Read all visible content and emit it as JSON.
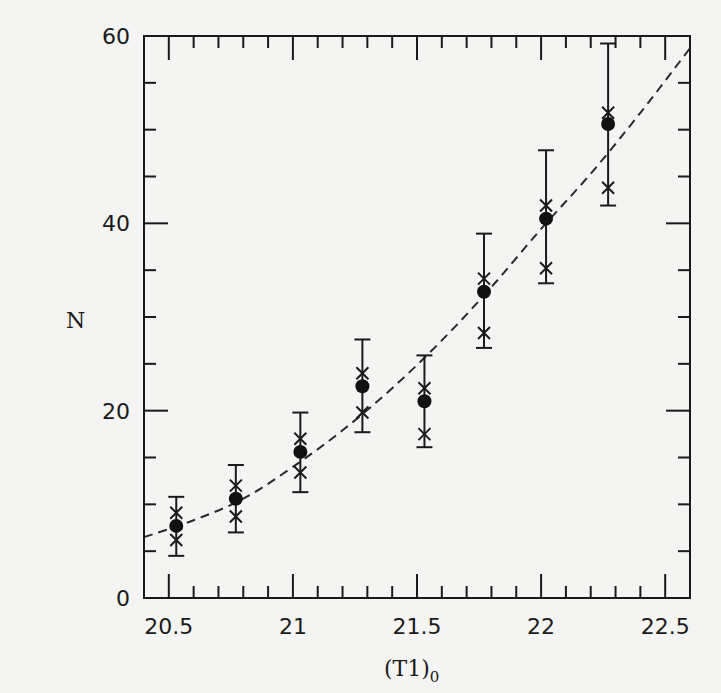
{
  "chart_data": {
    "type": "scatter",
    "title": "",
    "xlabel": "(T1)",
    "xlabel_subscript": "0",
    "ylabel": "N",
    "xlim": [
      20.4,
      22.6
    ],
    "ylim": [
      0,
      60
    ],
    "grid": false,
    "legend": null,
    "x_ticks_major": [
      20.5,
      21,
      21.5,
      22,
      22.5
    ],
    "x_tick_labels": [
      "20.5",
      "21",
      "21.5",
      "22",
      "22.5"
    ],
    "x_minor_step": 0.1,
    "y_ticks_major": [
      0,
      20,
      40,
      60
    ],
    "y_tick_labels": [
      "0",
      "20",
      "40",
      "60"
    ],
    "y_minor_step": 5,
    "series": [
      {
        "name": "observed N (filled circles with error bars)",
        "marker": "filled-circle",
        "points": [
          {
            "x": 20.53,
            "y": 7.7,
            "err_low": 4.5,
            "err_high": 10.8,
            "cross_high": 9.1,
            "cross_low": 6.2
          },
          {
            "x": 20.77,
            "y": 10.6,
            "err_low": 7.0,
            "err_high": 14.2,
            "cross_high": 12.0,
            "cross_low": 8.7
          },
          {
            "x": 21.03,
            "y": 15.6,
            "err_low": 11.3,
            "err_high": 19.8,
            "cross_high": 17.0,
            "cross_low": 13.4
          },
          {
            "x": 21.28,
            "y": 22.6,
            "err_low": 17.7,
            "err_high": 27.6,
            "cross_high": 24.0,
            "cross_low": 19.8
          },
          {
            "x": 21.53,
            "y": 21.0,
            "err_low": 16.1,
            "err_high": 25.9,
            "cross_high": 22.4,
            "cross_low": 17.5
          },
          {
            "x": 21.77,
            "y": 32.7,
            "err_low": 26.7,
            "err_high": 38.9,
            "cross_high": 34.1,
            "cross_low": 28.3
          },
          {
            "x": 22.02,
            "y": 40.5,
            "err_low": 33.6,
            "err_high": 47.8,
            "cross_high": 41.9,
            "cross_low": 35.2
          },
          {
            "x": 22.27,
            "y": 50.6,
            "err_low": 41.9,
            "err_high": 59.2,
            "cross_high": 51.8,
            "cross_low": 43.8
          }
        ]
      },
      {
        "name": "model fit (dashed curve)",
        "style": "dashed",
        "x": [
          20.4,
          20.6,
          20.8,
          21.0,
          21.2,
          21.4,
          21.6,
          21.8,
          22.0,
          22.2,
          22.4,
          22.6
        ],
        "y": [
          6.5,
          8.3,
          10.6,
          14.0,
          17.9,
          22.4,
          27.5,
          33.2,
          39.4,
          45.3,
          51.8,
          58.7
        ]
      }
    ]
  }
}
